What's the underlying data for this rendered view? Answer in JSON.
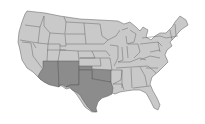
{
  "map": {
    "type": "choropleth",
    "region": "United States (contiguous)",
    "colors": {
      "default_state": "#c9c9c9",
      "highlighted_state": "#8c8c8c",
      "border": "#5a5a5a",
      "background": "#ffffff"
    },
    "highlighted_region": "Southwest",
    "highlighted_states": [
      "Arizona",
      "New Mexico",
      "Texas",
      "Oklahoma"
    ]
  }
}
